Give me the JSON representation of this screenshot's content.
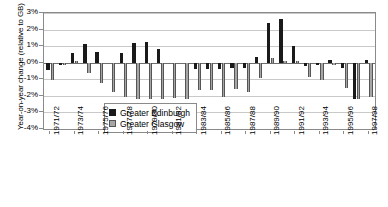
{
  "chart_data": {
    "type": "bar",
    "title": "",
    "xlabel": "",
    "ylabel": "Year-on-year change (relative to GB)",
    "ylim": [
      -4,
      3
    ],
    "ytick_labels": [
      "3%",
      "2%",
      "1%",
      "0%",
      "-1%",
      "-2%",
      "-3%",
      "-4%"
    ],
    "ytick_values": [
      3,
      2,
      1,
      0,
      -1,
      -2,
      -3,
      -4
    ],
    "grid": true,
    "legend_position": "inside-lower-left",
    "categories": [
      "1971/72",
      "1972/73",
      "1973/74",
      "1974/75",
      "1975/76",
      "1976/77",
      "1977/78",
      "1978/79",
      "1979/80",
      "1980/81",
      "1981/82",
      "1982/83",
      "1983/84",
      "1984/85",
      "1985/86",
      "1986/87",
      "1987/88",
      "1988/89",
      "1989/90",
      "1990/91",
      "1991/92",
      "1992/93",
      "1993/94",
      "1994/95",
      "1995/96",
      "1996/97",
      "1997/98"
    ],
    "x_tick_labels_shown": [
      "1971/72",
      "1973/74",
      "1975/76",
      "1977/78",
      "1979/80",
      "1981/82",
      "1983/84",
      "1985/86",
      "1987/88",
      "1989/90",
      "1991/92",
      "1993/94",
      "1995/96",
      "1997/98"
    ],
    "series": [
      {
        "name": "Greater Edinburgh",
        "color": "#1a1a1a",
        "values": [
          -0.45,
          -0.12,
          0.58,
          1.12,
          0.62,
          0.0,
          0.6,
          1.22,
          1.25,
          0.85,
          0.0,
          0.0,
          -0.35,
          -0.38,
          -0.35,
          -0.3,
          -0.32,
          0.35,
          2.42,
          2.65,
          0.98,
          -0.22,
          -0.15,
          0.18,
          -0.3,
          -2.2,
          0.18
        ]
      },
      {
        "name": "Greater Glasgow",
        "color": "#a6a6a6",
        "values": [
          -1.02,
          -0.12,
          0.12,
          -0.65,
          -1.25,
          -1.78,
          -2.05,
          -2.2,
          -2.22,
          -2.2,
          -2.1,
          -2.18,
          -1.62,
          -1.65,
          -2.05,
          -1.58,
          -1.78,
          -0.95,
          0.28,
          0.1,
          0.08,
          -0.88,
          -1.05,
          -0.15,
          -1.55,
          -2.2,
          -2.08
        ]
      }
    ]
  },
  "legend": {
    "entries": [
      {
        "label": "Greater Edinburgh",
        "swatch": "edi"
      },
      {
        "label": "Greater Glasgow",
        "swatch": "gla"
      }
    ]
  }
}
